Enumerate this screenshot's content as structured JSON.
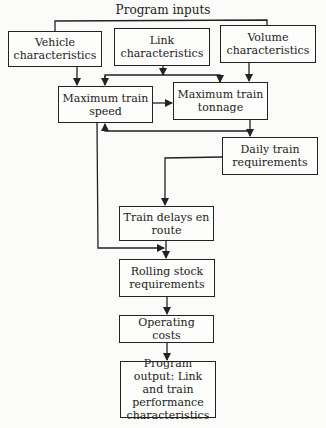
{
  "diagram": {
    "title": "Program inputs",
    "nodes": {
      "vehicle": "Vehicle characteristics",
      "link": "Link characteristics",
      "volume": "Volume characteristics",
      "max_speed": "Maximum train speed",
      "max_tonnage": "Maximum train tonnage",
      "daily_train": "Daily train requirements",
      "train_delays": "Train delays en route",
      "rolling_stock": "Rolling stock requirements",
      "operating_costs": "Operating costs",
      "output": "Program output: Link and train performance characteristics"
    },
    "edges": [
      [
        "vehicle",
        "max_speed"
      ],
      [
        "link",
        "max_speed"
      ],
      [
        "link",
        "max_tonnage"
      ],
      [
        "volume",
        "max_tonnage"
      ],
      [
        "max_speed",
        "max_tonnage"
      ],
      [
        "max_tonnage",
        "daily_train"
      ],
      [
        "max_tonnage",
        "max_speed"
      ],
      [
        "daily_train",
        "train_delays"
      ],
      [
        "max_speed",
        "rolling_stock"
      ],
      [
        "train_delays",
        "rolling_stock"
      ],
      [
        "rolling_stock",
        "operating_costs"
      ],
      [
        "operating_costs",
        "output"
      ]
    ]
  }
}
